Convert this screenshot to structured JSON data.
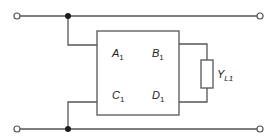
{
  "diagram": {
    "type": "two-port network with load admittance",
    "two_port": {
      "parameters": [
        {
          "symbol": "A",
          "subscript": "1"
        },
        {
          "symbol": "B",
          "subscript": "1"
        },
        {
          "symbol": "C",
          "subscript": "1"
        },
        {
          "symbol": "D",
          "subscript": "1"
        }
      ]
    },
    "load": {
      "symbol": "Y",
      "subscript": "L1"
    },
    "terminals": [
      "input-top",
      "input-bottom",
      "output-top",
      "output-bottom"
    ],
    "junctions": [
      "top-rail-junction",
      "bottom-rail-junction"
    ],
    "colors": {
      "line": "#555555",
      "junction": "#1a1a1a",
      "text": "#222222"
    }
  }
}
